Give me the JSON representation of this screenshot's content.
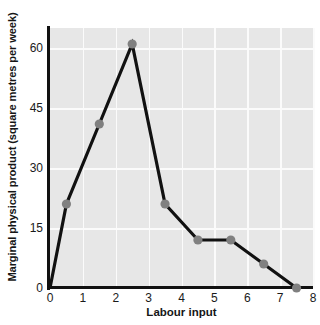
{
  "chart_data": {
    "type": "line",
    "title": "",
    "xlabel": "Labour input",
    "ylabel": "Marginal physical product (square metres per week)",
    "xlim": [
      0,
      8
    ],
    "ylim": [
      0,
      65
    ],
    "xticks": [
      "0",
      "1",
      "2",
      "3",
      "4",
      "5",
      "6",
      "7",
      "8"
    ],
    "xtick_values": [
      0,
      1,
      2,
      3,
      4,
      5,
      6,
      7,
      8
    ],
    "yticks": [
      "0",
      "15",
      "30",
      "45",
      "60"
    ],
    "ytick_values": [
      0,
      15,
      30,
      45,
      60
    ],
    "grid": true,
    "legend": "none",
    "series": [
      {
        "name": "Marginal physical product",
        "x": [
          0,
          0.5,
          1.5,
          2.5,
          3.5,
          4.5,
          5.5,
          6.5,
          7.5
        ],
        "values": [
          0,
          21,
          41,
          61,
          21,
          12,
          12,
          6,
          0
        ]
      }
    ],
    "marker_x": [
      0.5,
      1.5,
      2.5,
      3.5,
      4.5,
      5.5,
      6.5,
      7.5
    ],
    "marker_values": [
      21,
      41,
      61,
      21,
      12,
      12,
      6,
      0
    ],
    "colors": {
      "line": "#111111",
      "marker": "#808080",
      "panel_background": "#e7e7e7",
      "gridline": "#fbfbfb",
      "axis": "#111111",
      "text": "#1a1a1a"
    }
  }
}
